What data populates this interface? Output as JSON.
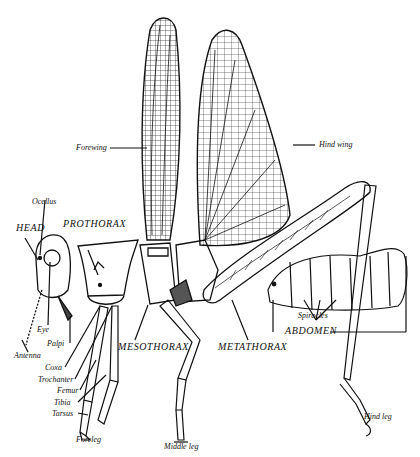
{
  "diagram": {
    "colors": {
      "ink": "#111111",
      "background": "#ffffff"
    },
    "labels": {
      "forewing": "Forewing",
      "hind_wing": "Hind wing",
      "ocellus": "Ocellus",
      "head": "HEAD",
      "prothorax": "PROTHORAX",
      "eye": "Eye",
      "palpi": "Palpi",
      "antenna": "Antenna",
      "mesothorax": "MESOTHORAX",
      "metathorax": "METATHORAX",
      "spiracles": "Spiracles",
      "abdomen": "ABDOMEN",
      "coxa": "Coxa",
      "trochanter": "Trochanter",
      "femur": "Femur",
      "tibia": "Tibia",
      "tarsus": "Tarsus",
      "foreleg": "Foreleg",
      "middle_leg": "Middle leg",
      "hind_leg": "Hind leg"
    }
  }
}
